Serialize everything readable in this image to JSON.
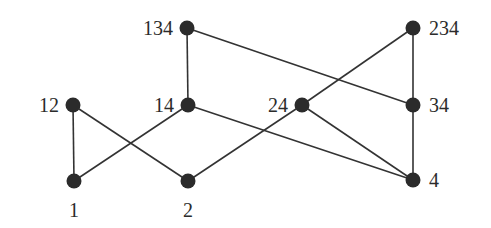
{
  "diagram": {
    "type": "hasse-diagram",
    "background": "#ffffff",
    "node_color": "#2b2b2b",
    "edge_color": "#333333",
    "nodes": [
      {
        "id": "1",
        "label": "1",
        "x": 74,
        "y": 181,
        "label_pos": "below"
      },
      {
        "id": "2",
        "label": "2",
        "x": 188,
        "y": 181,
        "label_pos": "below"
      },
      {
        "id": "4",
        "label": "4",
        "x": 413,
        "y": 180,
        "label_pos": "right"
      },
      {
        "id": "12",
        "label": "12",
        "x": 73,
        "y": 105,
        "label_pos": "left"
      },
      {
        "id": "14",
        "label": "14",
        "x": 188,
        "y": 105,
        "label_pos": "left"
      },
      {
        "id": "24",
        "label": "24",
        "x": 302,
        "y": 105,
        "label_pos": "left"
      },
      {
        "id": "34",
        "label": "34",
        "x": 413,
        "y": 105,
        "label_pos": "right"
      },
      {
        "id": "134",
        "label": "134",
        "x": 187,
        "y": 28,
        "label_pos": "left"
      },
      {
        "id": "234",
        "label": "234",
        "x": 413,
        "y": 28,
        "label_pos": "right"
      }
    ],
    "edges": [
      [
        "1",
        "12"
      ],
      [
        "1",
        "14"
      ],
      [
        "2",
        "12"
      ],
      [
        "2",
        "24"
      ],
      [
        "14",
        "134"
      ],
      [
        "14",
        "4"
      ],
      [
        "24",
        "234"
      ],
      [
        "24",
        "4"
      ],
      [
        "134",
        "34"
      ],
      [
        "234",
        "34"
      ],
      [
        "34",
        "4"
      ]
    ]
  }
}
